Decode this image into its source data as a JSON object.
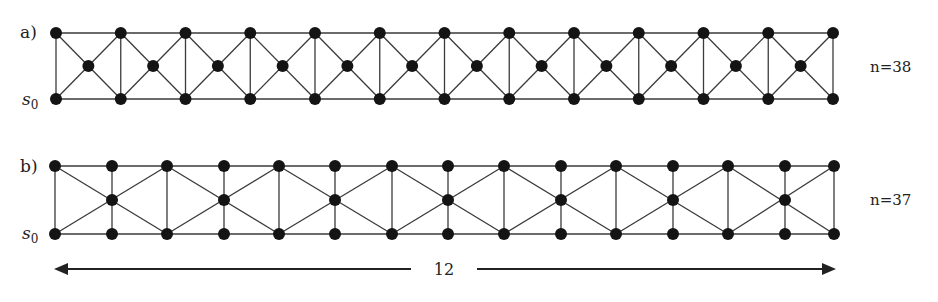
{
  "diagram": {
    "panels": [
      {
        "id": "a",
        "label": "a)",
        "start_label": "s",
        "start_sub": "0",
        "n_label": "n=38",
        "type": "alternating-middle",
        "columns": 13,
        "x_start": 56,
        "x_end": 833,
        "y_top": 33,
        "y_mid": 66,
        "y_bottom": 99,
        "node_count": 38
      },
      {
        "id": "b",
        "label": "b)",
        "start_label": "s",
        "start_sub": "0",
        "n_label": "n=37",
        "type": "column-middle",
        "columns_x": [
          55,
          112,
          167,
          224,
          279,
          335,
          392,
          448,
          504,
          561,
          616,
          673,
          728,
          785,
          834
        ],
        "y_top": 166,
        "y_mid": 200,
        "y_bottom": 234,
        "node_count": 37
      }
    ],
    "dimension": {
      "label": "12",
      "x_start": 54,
      "x_end": 836,
      "y": 269,
      "gap_left": 411,
      "gap_right": 477
    },
    "colors": {
      "node": "#141414",
      "edge": "#3a3a3a",
      "background": "#ffffff"
    }
  }
}
